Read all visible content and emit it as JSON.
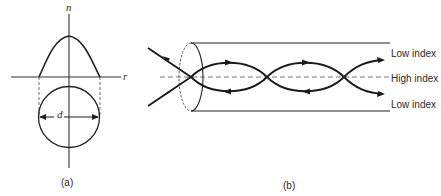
{
  "figure_a": {
    "axis_n_label": "n",
    "axis_r_label": "r",
    "diameter_label": "d",
    "caption": "(a)"
  },
  "figure_b": {
    "labels": {
      "top": "Low index",
      "middle": "High index",
      "bottom": "Low index"
    },
    "caption": "(b)"
  }
}
